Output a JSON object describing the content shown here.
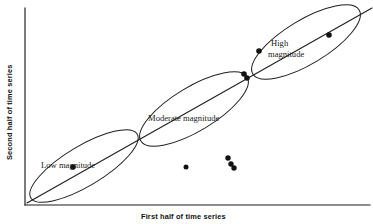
{
  "figure": {
    "title": "",
    "background_color": "#ffffff",
    "ink_color": "#1d1d1d"
  },
  "axes": {
    "x_label": "First half of time series",
    "y_label": "Second half of time series",
    "x_axis_name": "x-axis",
    "y_axis_name": "y-axis",
    "origin": [
      25,
      205
    ],
    "x_end": [
      370,
      205
    ],
    "y_end": [
      25,
      8
    ],
    "ticks": [],
    "grid": false
  },
  "chart_data": {
    "type": "scatter",
    "title": "",
    "xlabel": "First half of time series",
    "ylabel": "Second half of time series",
    "xlim": [
      0,
      100
    ],
    "ylim": [
      0,
      100
    ],
    "grid": false,
    "legend": "none",
    "annotations": [
      {
        "id": "low-magnitude",
        "text": "Low magnitude",
        "lines": [
          "Low magnitude"
        ],
        "x": 41,
        "y": 168
      },
      {
        "id": "moderate-magnitude",
        "text": "Moderate magnitude",
        "lines": [
          "Moderate magnitude"
        ],
        "x": 148,
        "y": 121
      },
      {
        "id": "high-magnitude",
        "text": "High magnitude",
        "lines": [
          "High",
          "magnitude"
        ],
        "x": 271,
        "y": 46
      }
    ],
    "trend_line": {
      "name": "diagonal-reference-line",
      "from": [
        27,
        203
      ],
      "to": [
        372,
        8
      ]
    },
    "clusters": [
      {
        "name": "low-magnitude",
        "label": "Low magnitude",
        "center": [
          84,
          166
        ],
        "angle_deg": -31,
        "rx": 62,
        "ry": 20
      },
      {
        "name": "moderate-magnitude",
        "label": "Moderate magnitude",
        "center": [
          194,
          109
        ],
        "angle_deg": -31,
        "rx": 62,
        "ry": 22
      },
      {
        "name": "high-magnitude",
        "label": "High magnitude",
        "center": [
          306,
          42
        ],
        "angle_deg": -31,
        "rx": 62,
        "ry": 22
      }
    ],
    "points": [
      {
        "x": 186,
        "y": 167,
        "r": 2.5
      },
      {
        "x": 228,
        "y": 158,
        "r": 2.7
      },
      {
        "x": 231,
        "y": 164,
        "r": 2.7
      },
      {
        "x": 234,
        "y": 168,
        "r": 2.7
      },
      {
        "x": 244,
        "y": 74,
        "r": 2.8
      },
      {
        "x": 247,
        "y": 78,
        "r": 2.8
      },
      {
        "x": 259,
        "y": 51,
        "r": 2.8
      },
      {
        "x": 329,
        "y": 35,
        "r": 2.8
      },
      {
        "x": 73,
        "y": 167,
        "r": 2.8
      }
    ]
  }
}
